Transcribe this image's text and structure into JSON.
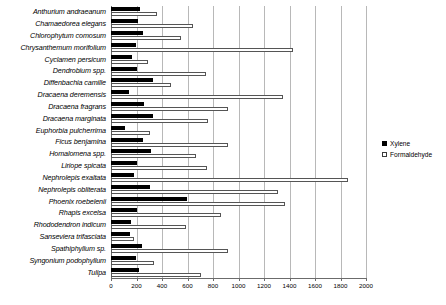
{
  "chart_data": {
    "type": "bar",
    "orientation": "horizontal",
    "title": "",
    "xlabel": "",
    "ylabel": "",
    "xlim": [
      0,
      2000
    ],
    "xticks": [
      0,
      200,
      400,
      600,
      800,
      1000,
      1200,
      1400,
      1600,
      1800,
      2000
    ],
    "xtick_labels": [
      "0",
      "200",
      "400",
      "600",
      "800",
      "1000",
      "1200",
      "1400",
      "1600",
      "1800",
      "2000"
    ],
    "grid": true,
    "grid_axis": "x",
    "legend_position": "right",
    "categories": [
      "Anthurium andraeanum",
      "Chamaedorea elegans",
      "Chlorophytum comosum",
      "Chrysanthemum morifolium",
      "Cyclamen persicum",
      "Dendrobium spp.",
      "Diffenbachia camille",
      "Dracaena deremensis",
      "Dracaena fragrans",
      "Dracaena marginata",
      "Euphorbia pulcherrima",
      "Ficus benjamina",
      "Homalomena spp.",
      "Liriope spicata",
      "Nephrolepis exaltata",
      "Nephrolepis obliterata",
      "Phoenix roebelenii",
      "Rhapis excelsa",
      "Rhododendron indicum",
      "Sanseviera trifasciata",
      "Spathiphyllum sp.",
      "Syngonium podophyllum",
      "Tulipa"
    ],
    "series": [
      {
        "name": "Xylene",
        "color": "#000000",
        "style": "filled",
        "values": [
          227,
          212,
          251,
          196,
          165,
          204,
          331,
          141,
          259,
          331,
          110,
          251,
          314,
          204,
          180,
          306,
          596,
          204,
          157,
          149,
          243,
          196,
          220
        ]
      },
      {
        "name": "Formaldehyde",
        "color": "#ffffff",
        "style": "open",
        "values": [
          361,
          643,
          549,
          1427,
          290,
          749,
          470,
          1349,
          918,
          757,
          306,
          918,
          667,
          753,
          1859,
          1310,
          1365,
          863,
          588,
          180,
          918,
          337,
          706
        ]
      }
    ]
  },
  "legend": {
    "entries": [
      {
        "label": "Xylene",
        "swatch": "filled-square-icon"
      },
      {
        "label": "Formaldehyde",
        "swatch": "open-square-icon"
      }
    ]
  }
}
